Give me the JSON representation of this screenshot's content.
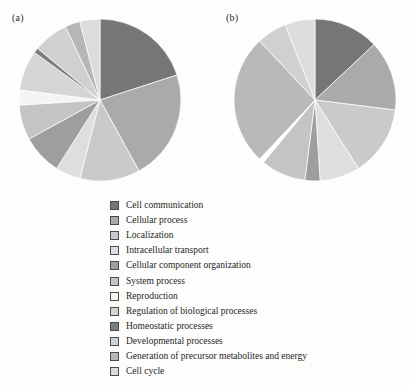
{
  "figure": {
    "background_color": "#fdfdfb",
    "panels": [
      {
        "id": "a",
        "label": "(a)"
      },
      {
        "id": "b",
        "label": "(b)"
      }
    ]
  },
  "legend": {
    "position": "below",
    "items": [
      {
        "label": "Cell communication",
        "color": "#767676"
      },
      {
        "label": "Cellular process",
        "color": "#aaaaaa"
      },
      {
        "label": "Localization",
        "color": "#cacaca"
      },
      {
        "label": "Intracellular transport",
        "color": "#dedede"
      },
      {
        "label": "Cellular component organization",
        "color": "#9e9e9e"
      },
      {
        "label": "System process",
        "color": "#c4c4c4"
      },
      {
        "label": "Reproduction",
        "color": "#f4f4f2"
      },
      {
        "label": "Regulation of biological processes",
        "color": "#d5d5d5"
      },
      {
        "label": "Homeostatic processes",
        "color": "#7d7d7d"
      },
      {
        "label": "Developmental processes",
        "color": "#d0d0d0"
      },
      {
        "label": "Generation of precursor metabolites and energy",
        "color": "#b6b6b6"
      },
      {
        "label": "Cell cycle",
        "color": "#dcdcdc"
      }
    ]
  },
  "chart_data": [
    {
      "type": "pie",
      "id": "a",
      "title": "(a)",
      "start_angle_deg": 0,
      "direction": "clockwise",
      "center": [
        82,
        82
      ],
      "radius": 81,
      "categories": [
        "Cell communication",
        "Cellular process",
        "Localization",
        "Intracellular transport",
        "Cellular component organization",
        "System process",
        "Reproduction",
        "Regulation of biological processes",
        "Homeostatic processes",
        "Developmental processes",
        "Generation of precursor metabolites and energy",
        "Cell cycle"
      ],
      "values": [
        20.0,
        22.0,
        12.0,
        5.0,
        8.0,
        7.0,
        3.0,
        8.0,
        1.0,
        7.0,
        3.0,
        4.0
      ],
      "colors": [
        "#767676",
        "#aaaaaa",
        "#cacaca",
        "#dedede",
        "#9e9e9e",
        "#c4c4c4",
        "#f4f4f2",
        "#d5d5d5",
        "#7d7d7d",
        "#d0d0d0",
        "#b6b6b6",
        "#dcdcdc"
      ],
      "units": "percent"
    },
    {
      "type": "pie",
      "id": "b",
      "title": "(b)",
      "start_angle_deg": 0,
      "direction": "clockwise",
      "center": [
        82,
        82
      ],
      "radius": 81,
      "categories": [
        "Cell communication",
        "Cellular process",
        "Localization",
        "Intracellular transport",
        "Cellular component organization",
        "System process",
        "Reproduction",
        "Regulation of biological processes",
        "Homeostatic processes",
        "Developmental processes",
        "Generation of precursor metabolites and energy",
        "Cell cycle"
      ],
      "values": [
        13.0,
        14.0,
        14.0,
        8.0,
        3.0,
        9.0,
        1.0,
        26.0,
        0.0,
        6.0,
        0.0,
        6.0
      ],
      "colors": [
        "#767676",
        "#aaaaaa",
        "#cacaca",
        "#dedede",
        "#9e9e9e",
        "#c4c4c4",
        "#ffffff",
        "#b9b9b9",
        "#7d7d7d",
        "#d0d0d0",
        "#b6b6b6",
        "#dcdcdc"
      ],
      "units": "percent"
    }
  ]
}
